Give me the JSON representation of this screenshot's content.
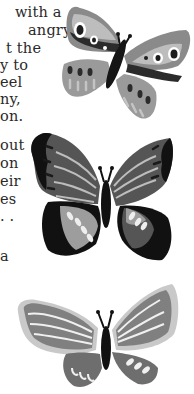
{
  "page": {
    "text_fragments": [
      {
        "text": "with a",
        "top": 4,
        "right": 15
      },
      {
        "text": "angry",
        "top": 22,
        "right": 16
      },
      {
        "text": "t the",
        "top": 40,
        "right": 29
      },
      {
        "text": "y to",
        "top": 57,
        "right": 35
      },
      {
        "text": "eel",
        "top": 74,
        "right": 37
      },
      {
        "text": "ny,",
        "top": 91,
        "right": 36
      },
      {
        "text": "on.",
        "top": 108,
        "right": 36
      },
      {
        "text": "out",
        "top": 137,
        "right": 46
      },
      {
        "text": "on",
        "top": 155,
        "right": 46
      },
      {
        "text": "eir",
        "top": 173,
        "right": 46
      },
      {
        "text": "es",
        "top": 191,
        "right": 47
      },
      {
        "text": ". .",
        "top": 208,
        "right": 47
      },
      {
        "text": "a",
        "top": 248,
        "left": 0
      }
    ],
    "illustrations": [
      {
        "name": "butterfly-top",
        "description": "grey butterfly with spotted wings"
      },
      {
        "name": "butterfly-middle",
        "description": "dark butterfly with striped wings"
      },
      {
        "name": "butterfly-bottom",
        "description": "light grey butterfly with scalloped wings"
      }
    ]
  }
}
